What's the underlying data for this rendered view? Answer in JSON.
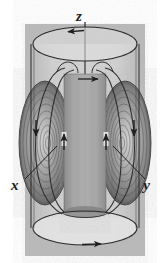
{
  "figure": {
    "type": "scientific-illustration",
    "background_color": "#ffffff",
    "panel_color": "#b9b9b9"
  },
  "labels": {
    "z": "z",
    "x": "x",
    "y": "y"
  },
  "colors": {
    "panel": "#b9b9b9",
    "cylinder_body": "#c6c6c6",
    "cylinder_cap_top": "#dcdcdc",
    "cylinder_cap_bottom": "#dadada",
    "outline": "#2b2b2b",
    "lobe_dark": "#5d5d5d",
    "lobe_mid": "#8a8a8a",
    "lobe_light": "#bdbdbd",
    "core_column": "#9a9a9a",
    "arrow": "#1f1f1f",
    "label_text": "#1a1a1a",
    "leader_line": "#222222"
  },
  "geometry": {
    "panel": {
      "x": 25,
      "y": 24,
      "width": 120,
      "height": 232
    },
    "cylinder": {
      "center_x": 85,
      "top_cap_cy": 44,
      "bottom_cap_cy": 228,
      "rx": 52,
      "ry": 17
    },
    "axis_line": {
      "x": 85,
      "y1": 22,
      "y2": 82
    },
    "core_column": {
      "x": 64,
      "y": 72,
      "width": 42,
      "height": 140
    },
    "lobe_left_cx": 45,
    "lobe_right_cx": 125,
    "lobe_cy": 143
  },
  "annotations": {
    "z_label_pos": {
      "x": 80,
      "y": 20
    },
    "x_label_pos": {
      "x": 11,
      "y": 186
    },
    "y_label_pos": {
      "x": 139,
      "y": 186
    },
    "x_leader": {
      "x1": 26,
      "y1": 178,
      "x2": 55,
      "y2": 147
    },
    "y_leader": {
      "x1": 144,
      "y1": 178,
      "x2": 115,
      "y2": 147
    }
  },
  "flow_arrows": [
    {
      "name": "top-rim-circulation",
      "direction": "left",
      "x": 72,
      "y": 32
    },
    {
      "name": "bottom-rim-circulation",
      "direction": "right",
      "x": 98,
      "y": 245
    },
    {
      "name": "inner-top-circulation",
      "direction": "right",
      "x": 96,
      "y": 79
    },
    {
      "name": "left-outer-descending",
      "direction": "down",
      "x": 36,
      "y": 132
    },
    {
      "name": "right-outer-descending",
      "direction": "down",
      "x": 134,
      "y": 132
    },
    {
      "name": "left-inner-ascending",
      "direction": "up",
      "x": 64,
      "y": 140
    },
    {
      "name": "right-inner-ascending",
      "direction": "up",
      "x": 106,
      "y": 140
    }
  ],
  "contour_rings": {
    "count_per_lobe": 9,
    "description": "nested elliptical contour rings forming toroidal vortex cross-sections"
  }
}
